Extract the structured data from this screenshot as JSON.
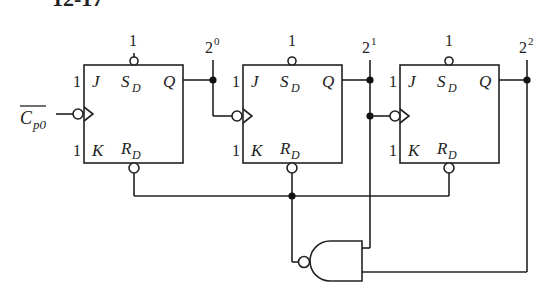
{
  "header": {
    "partial_title": "12-17"
  },
  "circuit": {
    "description": "Modulo-6 synchronous counter from three JK flip-flops with asynchronous reset via NAND gate",
    "clock_input": {
      "main": "C",
      "sub": "p0",
      "overbar": true
    },
    "flip_flops": [
      {
        "id": "FF0",
        "pins": {
          "j": "J",
          "k": "K",
          "q": "Q",
          "sd_main": "S",
          "sd_sub": "D",
          "rd_main": "R",
          "rd_sub": "D"
        },
        "j_value": "1",
        "k_value": "1",
        "sd_value": "1",
        "output_label": {
          "base": "2",
          "exp": "0"
        }
      },
      {
        "id": "FF1",
        "pins": {
          "j": "J",
          "k": "K",
          "q": "Q",
          "sd_main": "S",
          "sd_sub": "D",
          "rd_main": "R",
          "rd_sub": "D"
        },
        "j_value": "1",
        "k_value": "1",
        "sd_value": "1",
        "output_label": {
          "base": "2",
          "exp": "1"
        }
      },
      {
        "id": "FF2",
        "pins": {
          "j": "J",
          "k": "K",
          "q": "Q",
          "sd_main": "S",
          "sd_sub": "D",
          "rd_main": "R",
          "rd_sub": "D"
        },
        "j_value": "1",
        "k_value": "1",
        "sd_value": "1",
        "output_label": {
          "base": "2",
          "exp": "2"
        }
      }
    ],
    "gate": {
      "type": "NAND",
      "inputs": [
        "2^1",
        "2^2"
      ],
      "output": "R_D bus"
    }
  }
}
